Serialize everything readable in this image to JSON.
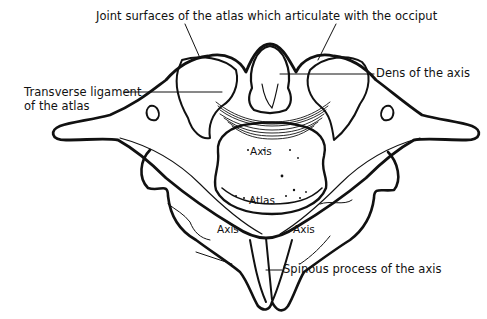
{
  "diagram": {
    "labels": {
      "joint_surfaces": "Joint surfaces of the atlas which articulate with the occiput",
      "dens": "Dens of the axis",
      "transverse_ligament_line1": "Transverse ligament",
      "transverse_ligament_line2": "of the atlas",
      "spinous_process": "Spinous process of the axis"
    },
    "inline_labels": {
      "axis_center": "Axis",
      "atlas": "Atlas",
      "axis_left": "Axis",
      "axis_right": "Axis"
    },
    "colors": {
      "ink": "#111111",
      "background": "#ffffff"
    }
  }
}
